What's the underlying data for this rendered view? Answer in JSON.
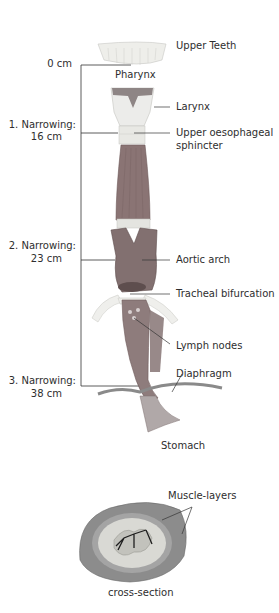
{
  "diagram": {
    "left_labels": {
      "zero": "0 cm",
      "n1_line1": "1. Narrowing:",
      "n1_line2": "16 cm",
      "n2_line1": "2. Narrowing:",
      "n2_line2": "23 cm",
      "n3_line1": "3. Narrowing:",
      "n3_line2": "38 cm"
    },
    "right_labels": {
      "upper_teeth": "Upper Teeth",
      "pharynx": "Pharynx",
      "larynx": "Larynx",
      "ues_line1": "Upper oesophageal",
      "ues_line2": "sphincter",
      "aortic_arch": "Aortic arch",
      "tracheal_bifurcation": "Tracheal bifurcation",
      "lymph_nodes": "Lymph nodes",
      "diaphragm": "Diaphragm",
      "stomach": "Stomach",
      "muscle_layers": "Muscle-layers",
      "cross_section": "cross-section"
    },
    "colors": {
      "muscle": "#8a7272",
      "muscle_dark": "#6e5a5a",
      "cartilage": "#e6e6e2",
      "line": "#333333",
      "cross_outer": "#8c8c8c",
      "cross_inner": "#d9d9d4"
    }
  }
}
